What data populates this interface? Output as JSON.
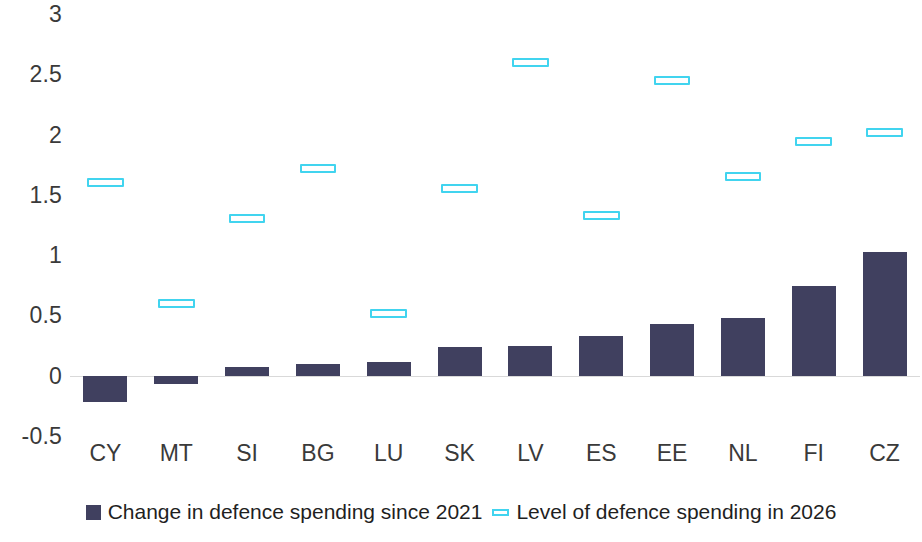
{
  "chart_data": {
    "type": "bar",
    "title": "",
    "subtitle": "",
    "xlabel": "",
    "ylabel": "",
    "ylim": [
      -0.5,
      3
    ],
    "ytick_step": 0.5,
    "grid": false,
    "legend_position": "bottom",
    "categories": [
      "CY",
      "MT",
      "SI",
      "BG",
      "LU",
      "SK",
      "LV",
      "ES",
      "EE",
      "NL",
      "FI",
      "CZ"
    ],
    "ytick_labels": [
      "3",
      "2.5",
      "2",
      "1.5",
      "1",
      "0.5",
      "0",
      "-0.5"
    ],
    "ytick_values": [
      3,
      2.5,
      2,
      1.5,
      1,
      0.5,
      0,
      -0.5
    ],
    "series": [
      {
        "name": "Change in defence spending since 2021",
        "marker_type": "bar",
        "color": "#40405f",
        "values": [
          -0.22,
          -0.07,
          0.07,
          0.1,
          0.11,
          0.24,
          0.25,
          0.33,
          0.43,
          0.48,
          0.74,
          1.03
        ]
      },
      {
        "name": "Level of defence spending in 2026",
        "marker_type": "dash",
        "color": "#41d4ef",
        "values": [
          1.6,
          0.6,
          1.3,
          1.72,
          0.52,
          1.55,
          2.6,
          1.33,
          2.45,
          1.65,
          1.94,
          2.02
        ]
      }
    ]
  },
  "legend": {
    "entries": [
      {
        "label": "Change in defence spending since 2021",
        "swatch": "bar"
      },
      {
        "label": "Level of defence spending in 2026",
        "swatch": "marker"
      }
    ]
  },
  "colors": {
    "bar": "#40405f",
    "marker": "#41d4ef",
    "axis_text": "#3a3a3a",
    "zero_line": "#d9d9d9",
    "background": "#ffffff"
  }
}
